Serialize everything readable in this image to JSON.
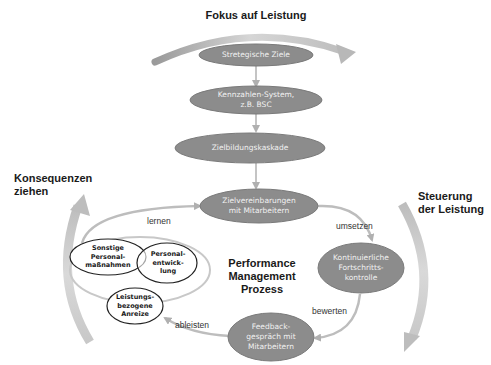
{
  "title": "Fokus auf Leistung",
  "side_labels": {
    "left": "Konsequenzen\nziehen",
    "right": "Steuerung\nder Leistung"
  },
  "center_label": "Performance\nManagement\nProzess",
  "cascade_nodes": [
    {
      "id": "strategische-ziele",
      "label": "Stretegische Ziele"
    },
    {
      "id": "kennzahlen-system",
      "label": "Kennzahlen-System,\nz.B. BSC"
    },
    {
      "id": "zielbildungskaskade",
      "label": "Zielbildungskaskade"
    }
  ],
  "cycle_nodes": [
    {
      "id": "zielvereinbarungen",
      "label": "Zielvereinbarungen\nmit Mitarbeitern"
    },
    {
      "id": "fortschrittskontrolle",
      "label": "Kontinuierliche\nFortschritts-\nkontrolle"
    },
    {
      "id": "feedbackgespraech",
      "label": "Feedback-\ngespräch mit\nMitarbeitern"
    }
  ],
  "consequence_nodes": [
    {
      "id": "sonstige",
      "label": "Sonstige\nPersonal-\nmaßnahmen"
    },
    {
      "id": "personalentwicklung",
      "label": "Personal-\nentwick-\nlung"
    },
    {
      "id": "leistungsbezogene",
      "label": "Leistungs-\nbezogene\nAnreize"
    }
  ],
  "edge_labels": {
    "umsetzen": "umsetzen",
    "bewerten": "bewerten",
    "ableisten": "ableisten",
    "lernen": "lernen"
  },
  "colors": {
    "node_fill": "#8c8c8c",
    "node_stroke": "#7a7a7a",
    "arrow": "#b5b5b5",
    "big_arrow": "#c4c4c4",
    "small_node_stroke": "#222222"
  }
}
